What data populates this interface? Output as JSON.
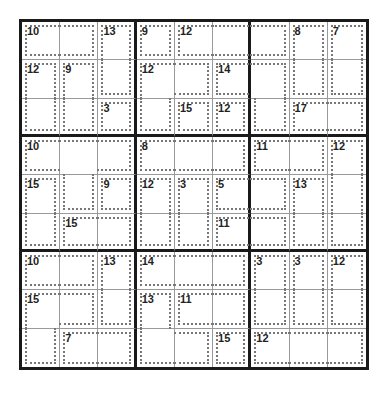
{
  "puzzle": {
    "type": "killer-sudoku",
    "size": 9,
    "cages": [
      {
        "sum": "10",
        "cells": [
          [
            0,
            0
          ],
          [
            0,
            1
          ]
        ]
      },
      {
        "sum": "13",
        "cells": [
          [
            0,
            2
          ],
          [
            1,
            2
          ]
        ]
      },
      {
        "sum": "9",
        "cells": [
          [
            0,
            3
          ]
        ]
      },
      {
        "sum": "12",
        "cells": [
          [
            0,
            4
          ],
          [
            0,
            5
          ],
          [
            0,
            6
          ]
        ]
      },
      {
        "sum": "8",
        "cells": [
          [
            0,
            7
          ],
          [
            1,
            7
          ]
        ]
      },
      {
        "sum": "7",
        "cells": [
          [
            0,
            8
          ],
          [
            1,
            8
          ]
        ]
      },
      {
        "sum": "12",
        "cells": [
          [
            1,
            0
          ],
          [
            2,
            0
          ]
        ]
      },
      {
        "sum": "9",
        "cells": [
          [
            1,
            1
          ],
          [
            2,
            1
          ]
        ]
      },
      {
        "sum": "12",
        "cells": [
          [
            1,
            3
          ],
          [
            1,
            4
          ],
          [
            2,
            3
          ]
        ]
      },
      {
        "sum": "14",
        "cells": [
          [
            1,
            5
          ],
          [
            1,
            6
          ],
          [
            2,
            6
          ]
        ]
      },
      {
        "sum": "3",
        "cells": [
          [
            2,
            2
          ]
        ]
      },
      {
        "sum": "15",
        "cells": [
          [
            2,
            4
          ]
        ]
      },
      {
        "sum": "12",
        "cells": [
          [
            2,
            5
          ]
        ]
      },
      {
        "sum": "17",
        "cells": [
          [
            2,
            7
          ],
          [
            2,
            8
          ]
        ]
      },
      {
        "sum": "10",
        "cells": [
          [
            3,
            0
          ],
          [
            3,
            1
          ],
          [
            3,
            2
          ],
          [
            4,
            1
          ]
        ]
      },
      {
        "sum": "8",
        "cells": [
          [
            3,
            3
          ],
          [
            3,
            4
          ],
          [
            3,
            5
          ]
        ]
      },
      {
        "sum": "11",
        "cells": [
          [
            3,
            6
          ],
          [
            3,
            7
          ]
        ]
      },
      {
        "sum": "12",
        "cells": [
          [
            3,
            8
          ],
          [
            4,
            8
          ],
          [
            5,
            8
          ]
        ]
      },
      {
        "sum": "15",
        "cells": [
          [
            4,
            0
          ],
          [
            5,
            0
          ]
        ]
      },
      {
        "sum": "9",
        "cells": [
          [
            4,
            2
          ]
        ]
      },
      {
        "sum": "3",
        "cells": [
          [
            4,
            4
          ],
          [
            5,
            4
          ]
        ]
      },
      {
        "sum": "5",
        "cells": [
          [
            4,
            5
          ],
          [
            4,
            6
          ]
        ]
      },
      {
        "sum": "13",
        "cells": [
          [
            4,
            7
          ],
          [
            5,
            7
          ]
        ]
      },
      {
        "sum": "15",
        "cells": [
          [
            5,
            1
          ],
          [
            5,
            2
          ]
        ]
      },
      {
        "sum": "12",
        "cells": [
          [
            4,
            3
          ],
          [
            5,
            3
          ]
        ]
      },
      {
        "sum": "11",
        "cells": [
          [
            5,
            5
          ],
          [
            5,
            6
          ]
        ]
      },
      {
        "sum": "10",
        "cells": [
          [
            6,
            0
          ],
          [
            6,
            1
          ]
        ]
      },
      {
        "sum": "13",
        "cells": [
          [
            6,
            2
          ],
          [
            7,
            2
          ]
        ]
      },
      {
        "sum": "14",
        "cells": [
          [
            6,
            3
          ],
          [
            6,
            4
          ],
          [
            6,
            5
          ]
        ]
      },
      {
        "sum": "3",
        "cells": [
          [
            6,
            6
          ],
          [
            7,
            6
          ]
        ]
      },
      {
        "sum": "3",
        "cells": [
          [
            6,
            7
          ],
          [
            7,
            7
          ]
        ]
      },
      {
        "sum": "12",
        "cells": [
          [
            6,
            8
          ],
          [
            7,
            8
          ]
        ]
      },
      {
        "sum": "15",
        "cells": [
          [
            7,
            0
          ],
          [
            7,
            1
          ],
          [
            8,
            0
          ]
        ]
      },
      {
        "sum": "13",
        "cells": [
          [
            7,
            3
          ],
          [
            8,
            3
          ],
          [
            8,
            4
          ]
        ]
      },
      {
        "sum": "11",
        "cells": [
          [
            7,
            4
          ],
          [
            7,
            5
          ]
        ]
      },
      {
        "sum": "7",
        "cells": [
          [
            8,
            1
          ],
          [
            8,
            2
          ]
        ]
      },
      {
        "sum": "15",
        "cells": [
          [
            8,
            5
          ]
        ]
      },
      {
        "sum": "12",
        "cells": [
          [
            8,
            6
          ],
          [
            8,
            7
          ],
          [
            8,
            8
          ]
        ]
      }
    ],
    "values": []
  }
}
